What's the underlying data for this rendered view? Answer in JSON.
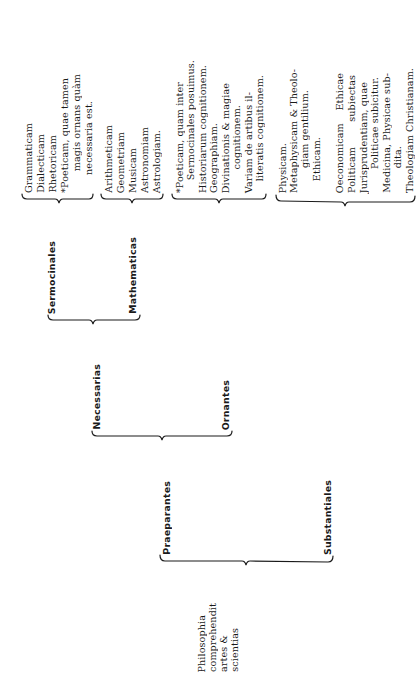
{
  "root": {
    "lines": [
      "Philosophia",
      "comprehendit",
      "artes &",
      "scientias"
    ]
  },
  "level1": {
    "praeparantes": "Praeparantes",
    "substantiales": "Substantiales"
  },
  "level2": {
    "necessarias": "Necessarias",
    "ornantes": "Ornantes"
  },
  "level3": {
    "sermocinales": "Sermocinales",
    "mathematicas": "Mathematicas"
  },
  "leaves": {
    "sermocinales": [
      "Grammaticam",
      "Dialecticam",
      "Rhetoricam",
      "*Poeticam, quae tamen",
      "magis ornans quàm",
      "necessaria est."
    ],
    "mathematicas": [
      "Arithmeticam",
      "Geometriam",
      "Musicam",
      "Astronomiam",
      "Astrologiam."
    ],
    "ornantes": [
      "*Poeticam, quam inter",
      "Sermocinales posuimus.",
      "Historiarum cognitionem.",
      "Geographiam.",
      "Divinationis & magiae",
      "cognitionem.",
      "Variam de artibus il-",
      "literatis cognitionem."
    ],
    "substantiales": [
      "Physicam.",
      "Metaphysicam & Theolo-",
      "giam gentilium.",
      "Ethicam.",
      "Oeconomicam    Ethicae",
      "Politicam        subiectas",
      "Jurisprudentiam, quae",
      "Politicae subicitur.",
      "Medicina, Physicae sub-",
      "dita.",
      "Theologiam Christianam."
    ]
  },
  "colors": {
    "ink": "#1a1a1a",
    "paper": "#ffffff"
  }
}
